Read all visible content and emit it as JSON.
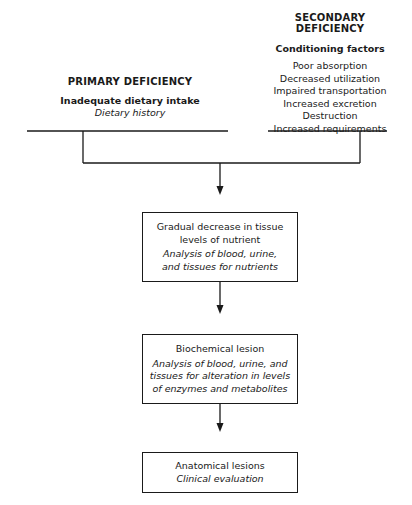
{
  "primary": {
    "title": "PRIMARY DEFICIENCY",
    "cause": "Inadequate dietary intake",
    "assessment": "Dietary history"
  },
  "secondary": {
    "title": "SECONDARY DEFICIENCY",
    "subtitle": "Conditioning factors",
    "factors": [
      "Poor absorption",
      "Decreased utilization",
      "Impaired transportation",
      "Increased excretion",
      "Destruction",
      "Increased requirements"
    ]
  },
  "stages": [
    {
      "title_lines": [
        "Gradual decrease in tissue",
        "levels of nutrient"
      ],
      "assessment_lines": [
        "Analysis of blood, urine,",
        "and tissues for nutrients"
      ]
    },
    {
      "title_lines": [
        "Biochemical lesion"
      ],
      "assessment_lines": [
        "Analysis of blood, urine, and",
        "tissues for alteration in levels",
        "of enzymes and metabolites"
      ]
    },
    {
      "title_lines": [
        "Anatomical lesions"
      ],
      "assessment_lines": [
        "Clinical evaluation"
      ]
    }
  ]
}
